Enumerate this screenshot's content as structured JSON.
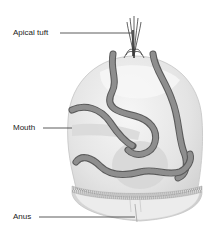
{
  "diagram": {
    "labels": [
      {
        "id": "apical-tuft",
        "text": "Apical tuft"
      },
      {
        "id": "mouth",
        "text": "Mouth"
      },
      {
        "id": "anus",
        "text": "Anus"
      }
    ]
  },
  "colors": {
    "background": "#ffffff",
    "body_fill": "#e6e6e6",
    "body_highlight": "#f4f4f4",
    "body_shadow": "#cfcfcf",
    "ciliary_band": "#7a7a7a",
    "ciliary_band_dark": "#555555",
    "leader_line": "#333333",
    "label_text": "#222222"
  }
}
